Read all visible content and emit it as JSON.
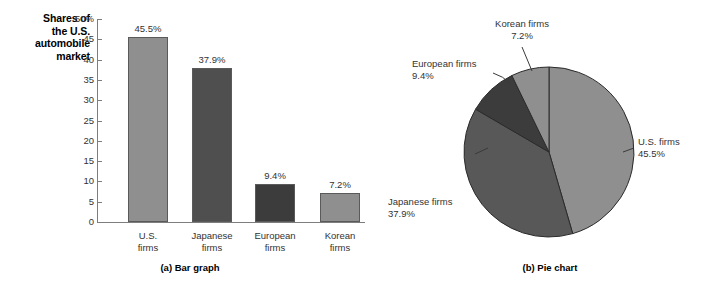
{
  "figure": {
    "background": "#ffffff"
  },
  "chart_data": [
    {
      "type": "bar",
      "panel": "a",
      "caption": "(a) Bar graph",
      "title": "",
      "ylabel": "Shares of the U.S. automobile market",
      "ylabel_lines": [
        "Shares of",
        "the U.S.",
        "automobile",
        "market"
      ],
      "xlabel": "",
      "categories": [
        "U.S. firms",
        "Japanese firms",
        "European firms",
        "Korean firms"
      ],
      "category_lines": [
        [
          "U.S.",
          "firms"
        ],
        [
          "Japanese",
          "firms"
        ],
        [
          "European",
          "firms"
        ],
        [
          "Korean",
          "firms"
        ]
      ],
      "values": [
        45.5,
        37.9,
        9.4,
        7.2
      ],
      "value_labels": [
        "45.5%",
        "37.9%",
        "9.4%",
        "7.2%"
      ],
      "bar_colors": [
        "#8f8f8f",
        "#4f4f4f",
        "#3c3c3c",
        "#8f8f8f"
      ],
      "bar_border": "#5a5a5a",
      "ylim": [
        0,
        50
      ],
      "ytick_values": [
        50,
        45,
        40,
        35,
        30,
        25,
        20,
        15,
        10,
        5,
        0
      ],
      "ytick_labels": [
        "50%",
        "45",
        "40",
        "35",
        "30",
        "25",
        "20",
        "15",
        "10",
        "5",
        "0"
      ],
      "grid": false,
      "legend": "none",
      "axis_color": "#7d7d7d"
    },
    {
      "type": "pie",
      "panel": "b",
      "caption": "(b) Pie chart",
      "title": "",
      "labels": [
        "U.S. firms",
        "Japanese firms",
        "European firms",
        "Korean firms"
      ],
      "values": [
        45.5,
        37.9,
        9.4,
        7.2
      ],
      "value_labels": [
        "45.5%",
        "37.9%",
        "9.4%",
        "7.2%"
      ],
      "slice_colors": [
        "#8f8f8f",
        "#585858",
        "#3c3c3c",
        "#8f8f8f"
      ],
      "slice_border": "#2b2b2b",
      "start_angle_deg": 0,
      "direction": "clockwise",
      "legend": "callout-labels",
      "annotations": [
        {
          "label": "U.S. firms",
          "pct": "45.5%",
          "position": "right"
        },
        {
          "label": "Japanese firms",
          "pct": "37.9%",
          "position": "lower-left"
        },
        {
          "label": "European firms",
          "pct": "9.4%",
          "position": "upper-left"
        },
        {
          "label": "Korean firms",
          "pct": "7.2%",
          "position": "top"
        }
      ]
    }
  ]
}
